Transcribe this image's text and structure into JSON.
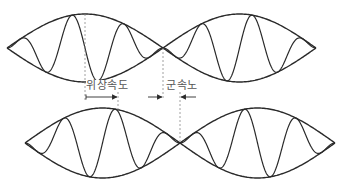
{
  "labels": {
    "phase_velocity": "위상속도",
    "group_velocity": "군속노"
  },
  "colors": {
    "stroke": "#2a2a2a",
    "dashed": "#888888",
    "text": "#555555",
    "background": "#ffffff"
  },
  "diagram": {
    "rows": [
      {
        "name": "top-wave-packet",
        "center_y": 48,
        "half_height": 34,
        "lobes": [
          [
            7,
            163
          ],
          [
            163,
            316
          ]
        ],
        "phase_marker_x": 85,
        "group_marker_x": 163
      },
      {
        "name": "bottom-wave-packet",
        "center_y": 143,
        "half_height": 35,
        "lobes": [
          [
            25,
            180
          ],
          [
            180,
            335
          ]
        ],
        "phase_marker_x": 118,
        "group_marker_x": 180
      }
    ],
    "arrows": {
      "y": 97,
      "phase": {
        "from": 85,
        "to": 118
      },
      "group_left": {
        "from": 148,
        "to": 163
      },
      "group_right": {
        "from": 196,
        "to": 180
      }
    }
  }
}
